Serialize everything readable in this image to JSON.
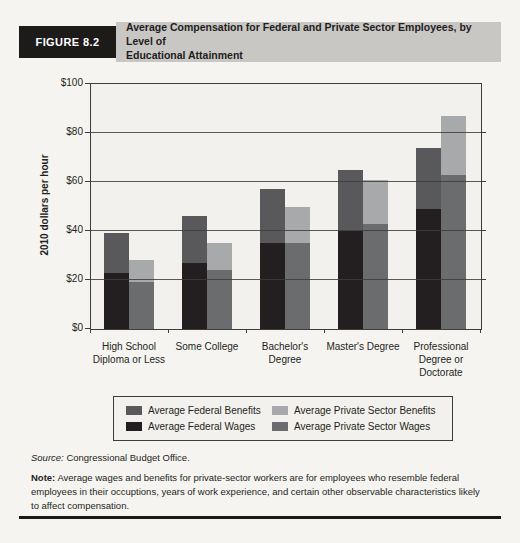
{
  "figure": {
    "label": "FIGURE 8.2",
    "title": "Average Compensation for Federal and Private Sector Employees, by Level of Educational Attainment",
    "title_lines": [
      "Average Compensation  for Federal and Private Sector Employees, by Level of",
      "Educational Attainment"
    ]
  },
  "colors": {
    "paper": "#f6f4f0",
    "plot_bg": "#f3f1ed",
    "figure_label_bg": "#1c1b1a",
    "figure_label_text": "#ffffff",
    "title_strip_bg": "#c9c7c3",
    "axis": "#3d3d3d",
    "text": "#231f20",
    "federal_wages": "#231f20",
    "federal_benefits": "#59595b",
    "private_wages": "#6b6c6e",
    "private_benefits": "#a8a9ab"
  },
  "chart_data": {
    "type": "bar",
    "stacked": true,
    "title": "Average Compensation for Federal and Private Sector Employees, by Level of Educational Attainment",
    "xlabel": "",
    "ylabel": "2010 dollars per hour",
    "ylim": [
      0,
      100
    ],
    "ytick_step": 20,
    "ytick_labels": [
      "$0",
      "$20",
      "$40",
      "$60",
      "$80",
      "$100"
    ],
    "grid": true,
    "legend_position": "bottom",
    "categories": [
      "High School Diploma or Less",
      "Some College",
      "Bachelor's Degree",
      "Master's Degree",
      "Professional Degree or Doctorate"
    ],
    "series": [
      {
        "name": "Average Federal Wages",
        "group": "Federal",
        "stack_order": 0,
        "color": "#231f20",
        "values": [
          23,
          27,
          35,
          40,
          49
        ]
      },
      {
        "name": "Average Federal Benefits",
        "group": "Federal",
        "stack_order": 1,
        "color": "#59595b",
        "values": [
          16,
          19,
          22,
          25,
          25
        ]
      },
      {
        "name": "Average Private Sector Wages",
        "group": "Private Sector",
        "stack_order": 0,
        "color": "#6b6c6e",
        "values": [
          19,
          24,
          35,
          43,
          63
        ]
      },
      {
        "name": "Average Private Sector Benefits",
        "group": "Private Sector",
        "stack_order": 1,
        "color": "#a8a9ab",
        "values": [
          9,
          11,
          15,
          18,
          24
        ]
      }
    ],
    "stack_totals": {
      "federal": [
        39,
        46,
        57,
        65,
        74
      ],
      "private_sector": [
        28,
        35,
        50,
        61,
        87
      ]
    }
  },
  "legend": {
    "items": [
      {
        "label": "Average Federal Benefits",
        "color": "#59595b"
      },
      {
        "label": "Average Private Sector Benefits",
        "color": "#a8a9ab"
      },
      {
        "label": "Average Federal Wages",
        "color": "#231f20"
      },
      {
        "label": "Average Private Sector Wages",
        "color": "#6b6c6e"
      }
    ]
  },
  "source": {
    "label": "Source:",
    "text": " Congressional Budget Office."
  },
  "note": {
    "label": "Note:",
    "text": " Average wages and benefits for private-sector workers are for employees who resemble federal employees in their occuptions, years of work experience, and certain other observable characteristics likely to affect compensation."
  }
}
